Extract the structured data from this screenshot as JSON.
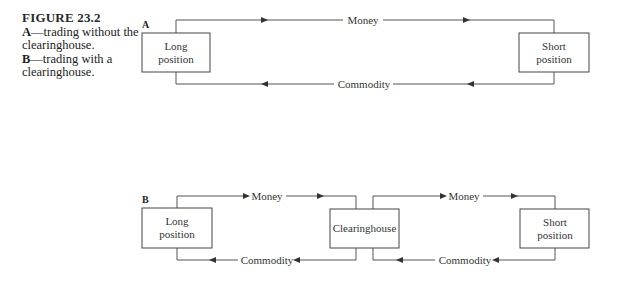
{
  "figure": {
    "title": "FIGURE 23.2",
    "caption_a_bold": "A",
    "caption_a_text": "—trading without the clearinghouse.",
    "caption_b_bold": "B",
    "caption_b_text": "—trading with a clearinghouse."
  },
  "panel_a": {
    "label": "A",
    "long_box": {
      "line1": "Long",
      "line2": "position"
    },
    "short_box": {
      "line1": "Short",
      "line2": "position"
    },
    "top_flow": "Money",
    "bottom_flow": "Commodity"
  },
  "panel_b": {
    "label": "B",
    "long_box": {
      "line1": "Long",
      "line2": "position"
    },
    "clearinghouse_box": "Clearinghouse",
    "short_box": {
      "line1": "Short",
      "line2": "position"
    },
    "left_top_flow": "Money",
    "left_bottom_flow": "Commodity",
    "right_top_flow": "Money",
    "right_bottom_flow": "Commodity"
  }
}
